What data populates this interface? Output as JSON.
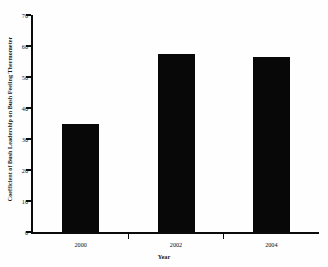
{
  "chart_data": {
    "type": "bar",
    "title": "",
    "subtitle": "",
    "xlabel": "Year",
    "ylabel": "Coefficient of Bush Leadership on Bush Feeling Thermometer",
    "categories": [
      "2000",
      "2002",
      "2004"
    ],
    "values": [
      35,
      57.5,
      56.5
    ],
    "series": [
      {
        "name": "Coefficient of Bush Leadership",
        "values": [
          35,
          57.5,
          56.5
        ]
      }
    ],
    "ylim": [
      0,
      70
    ],
    "yticks": [
      0,
      10,
      20,
      30,
      40,
      50,
      60,
      70
    ],
    "ytick_labels": [
      "0",
      "10",
      "20",
      "30",
      "40",
      "50",
      "60",
      "70"
    ],
    "xtick_labels": [
      "2000",
      "2002",
      "2004"
    ],
    "grid": false,
    "legend": false,
    "legend_position": "none",
    "bar_color": "#080808",
    "axis_color": "#0b0b0b",
    "background_color": "#fefefe"
  }
}
